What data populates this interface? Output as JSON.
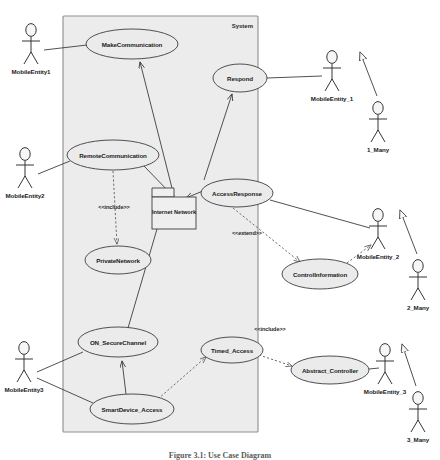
{
  "diagram": {
    "kind": "uml-use-case-diagram",
    "system_boundary_label": "System",
    "caption": "Figure 3.1: Use Case Diagram",
    "background_color": "#ffffff",
    "system_fill_color": "#ececec",
    "element_fill_color": "#ebebeb",
    "line_color": "#3d3d3d"
  },
  "use_cases": [
    {
      "id": "make_communication",
      "label": "MakeCommunication",
      "cx": 132,
      "cy": 44,
      "rx": 46,
      "ry": 15
    },
    {
      "id": "respond",
      "label": "Respond",
      "cx": 240,
      "cy": 78,
      "rx": 27,
      "ry": 14
    },
    {
      "id": "remote_communication",
      "label": "RemoteCommunication",
      "cx": 113,
      "cy": 155,
      "rx": 46,
      "ry": 15
    },
    {
      "id": "access_response",
      "label": "AccessResponse",
      "cx": 237,
      "cy": 193,
      "rx": 36,
      "ry": 14
    },
    {
      "id": "private_network",
      "label": "PrivateNetwork",
      "cx": 118,
      "cy": 260,
      "rx": 33,
      "ry": 14
    },
    {
      "id": "control_information",
      "label": "ControlInformation",
      "cx": 320,
      "cy": 274,
      "rx": 38,
      "ry": 15
    },
    {
      "id": "on_securechannel",
      "label": "ON_SecureChannel",
      "cx": 118,
      "cy": 342,
      "rx": 40,
      "ry": 15
    },
    {
      "id": "timed_access",
      "label": "Timed_Access",
      "cx": 232,
      "cy": 350,
      "rx": 31,
      "ry": 13
    },
    {
      "id": "smartdevice_access",
      "label": "SmartDevice_Access",
      "cx": 132,
      "cy": 409,
      "rx": 42,
      "ry": 15
    },
    {
      "id": "abstract_controller",
      "label": "Abstract_Controller",
      "cx": 330,
      "cy": 370,
      "rx": 39,
      "ry": 14
    }
  ],
  "nodes": [
    {
      "id": "internet_network",
      "label": "Internet Network",
      "x": 152,
      "y": 197,
      "w": 44,
      "h": 32
    }
  ],
  "actors": [
    {
      "id": "mobileentity1",
      "label": "MobileEntity1",
      "x": 31,
      "y": 28,
      "side": "left"
    },
    {
      "id": "mobileentity2",
      "label": "MobileEntity2",
      "x": 25,
      "y": 152,
      "side": "left"
    },
    {
      "id": "mobileentity3",
      "label": "MobileEntity3",
      "x": 24,
      "y": 346,
      "side": "left"
    },
    {
      "id": "mobileentity_1",
      "label": "MobileEntity_1",
      "x": 332,
      "y": 55,
      "side": "right"
    },
    {
      "id": "actor_1_many",
      "label": "1_Many",
      "x": 378,
      "y": 106,
      "side": "right"
    },
    {
      "id": "mobileentity_2",
      "label": "MobileEntity_2",
      "x": 378,
      "y": 213,
      "side": "right"
    },
    {
      "id": "actor_2_many",
      "label": "2_Many",
      "x": 418,
      "y": 264,
      "side": "right"
    },
    {
      "id": "mobileentity_3",
      "label": "MobileEntity_3",
      "x": 385,
      "y": 348,
      "side": "right"
    },
    {
      "id": "actor_3_many",
      "label": "3_Many",
      "x": 418,
      "y": 396,
      "side": "right"
    }
  ],
  "stereotype_labels": [
    {
      "id": "include_private_network",
      "text": "<<include>>",
      "x": 114,
      "y": 209
    },
    {
      "id": "extend_control_info",
      "text": "<<extend>>",
      "x": 247,
      "y": 235
    },
    {
      "id": "include_abstract_ctrl",
      "text": "<<include>>",
      "x": 270,
      "y": 331
    }
  ],
  "relationships": [
    {
      "from": "mobileentity1",
      "to": "make_communication",
      "type": "association"
    },
    {
      "from": "mobileentity2",
      "to": "remote_communication",
      "type": "association"
    },
    {
      "from": "mobileentity3",
      "to": "on_securechannel",
      "type": "association"
    },
    {
      "from": "mobileentity3",
      "to": "smartdevice_access",
      "type": "association"
    },
    {
      "from": "respond",
      "to": "mobileentity_1",
      "type": "association"
    },
    {
      "from": "access_response",
      "to": "mobileentity_2",
      "type": "association"
    },
    {
      "from": "abstract_controller",
      "to": "mobileentity_3",
      "type": "association"
    },
    {
      "from": "internet_network",
      "to": "make_communication",
      "type": "directed"
    },
    {
      "from": "internet_network",
      "to": "respond",
      "type": "directed"
    },
    {
      "from": "access_response",
      "to": "internet_network",
      "type": "directed"
    },
    {
      "from": "remote_communication",
      "to": "internet_network",
      "type": "association"
    },
    {
      "from": "remote_communication",
      "to": "private_network",
      "type": "include"
    },
    {
      "from": "internet_network",
      "to": "private_network",
      "type": "dependency"
    },
    {
      "from": "access_response",
      "to": "control_information",
      "type": "extend"
    },
    {
      "from": "control_information",
      "to": "mobileentity_2",
      "type": "dependency"
    },
    {
      "from": "internet_network",
      "to": "on_securechannel",
      "type": "association"
    },
    {
      "from": "smartdevice_access",
      "to": "on_securechannel",
      "type": "directed"
    },
    {
      "from": "smartdevice_access",
      "to": "timed_access",
      "type": "dependency"
    },
    {
      "from": "timed_access",
      "to": "abstract_controller",
      "type": "include"
    },
    {
      "from": "actor_1_many",
      "to": "mobileentity_1",
      "type": "generalization"
    },
    {
      "from": "actor_2_many",
      "to": "mobileentity_2",
      "type": "generalization"
    },
    {
      "from": "actor_3_many",
      "to": "mobileentity_3",
      "type": "generalization"
    }
  ]
}
